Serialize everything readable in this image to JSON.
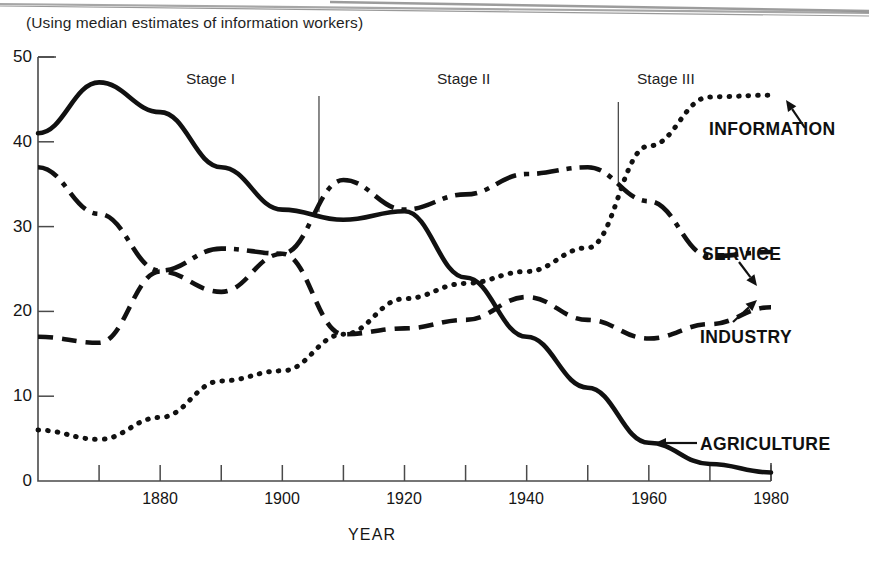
{
  "figure": {
    "subtitle": "(Using median estimates of information workers)",
    "xaxis_title": "YEAR"
  },
  "chart_data": {
    "type": "line",
    "title": "",
    "subtitle": "(Using median estimates of information workers)",
    "xlabel": "YEAR",
    "ylabel": "",
    "xlim": [
      1860,
      1980
    ],
    "ylim": [
      0,
      50
    ],
    "grid": false,
    "legend_position": "inline-right-annotations",
    "x_tick_labels": [
      "1880",
      "1900",
      "1920",
      "1940",
      "1960",
      "1980"
    ],
    "x_tick_values": [
      1880,
      1900,
      1920,
      1940,
      1960,
      1980
    ],
    "x_minor_ticks": [
      1860,
      1870,
      1880,
      1890,
      1900,
      1910,
      1920,
      1930,
      1940,
      1950,
      1960,
      1970,
      1980
    ],
    "y_tick_labels": [
      "0",
      "10",
      "20",
      "30",
      "40",
      "50"
    ],
    "y_tick_values": [
      0,
      10,
      20,
      30,
      40,
      50
    ],
    "x": [
      1860,
      1870,
      1880,
      1890,
      1900,
      1910,
      1920,
      1930,
      1940,
      1950,
      1960,
      1970,
      1980
    ],
    "series": [
      {
        "name": "AGRICULTURE",
        "style": "solid",
        "values": [
          41.0,
          47.0,
          43.5,
          37.0,
          32.0,
          30.8,
          31.8,
          24.0,
          17.0,
          11.0,
          4.5,
          2.0,
          1.0
        ]
      },
      {
        "name": "INDUSTRY",
        "style": "dashed",
        "values": [
          17.0,
          16.3,
          24.7,
          22.3,
          26.8,
          17.3,
          18.0,
          19.0,
          21.7,
          19.0,
          16.8,
          18.5,
          20.5
        ]
      },
      {
        "name": "SERVICE",
        "style": "dash-dot",
        "values": [
          37.0,
          31.5,
          24.8,
          27.4,
          26.8,
          35.5,
          32.0,
          33.8,
          36.2,
          37.0,
          33.0,
          26.5,
          27.0
        ]
      },
      {
        "name": "INFORMATION",
        "style": "dotted",
        "values": [
          6.0,
          4.9,
          7.5,
          11.8,
          13.0,
          17.3,
          21.5,
          23.3,
          24.7,
          27.5,
          39.5,
          45.3,
          45.5
        ]
      }
    ],
    "annotations": [
      {
        "text": "Stage I",
        "kind": "stage-label",
        "x": 1889
      },
      {
        "text": "Stage II",
        "kind": "stage-label",
        "x": 1931
      },
      {
        "text": "Stage III",
        "kind": "stage-label",
        "x": 1958
      },
      {
        "text": "Stage I / Stage II divider",
        "kind": "divider",
        "x": 1906
      },
      {
        "text": "Stage II / Stage III divider",
        "kind": "divider",
        "x": 1955
      }
    ],
    "series_callouts": [
      {
        "label": "INFORMATION",
        "points_to": "INFORMATION"
      },
      {
        "label": "SERVICE",
        "points_to": "SERVICE"
      },
      {
        "label": "INDUSTRY",
        "points_to": "INDUSTRY"
      },
      {
        "label": "AGRICULTURE",
        "points_to": "AGRICULTURE"
      }
    ]
  },
  "axis": {
    "y_labels": [
      "50",
      "40",
      "30",
      "20",
      "10",
      "0"
    ],
    "x_labels": [
      "1880",
      "1900",
      "1920",
      "1940",
      "1960",
      "1980"
    ]
  },
  "stages": {
    "one": "Stage I",
    "two": "Stage II",
    "three": "Stage III"
  },
  "series_labels": {
    "information": "INFORMATION",
    "service": "SERVICE",
    "industry": "INDUSTRY",
    "agriculture": "AGRICULTURE"
  },
  "colors": {
    "ink": "#111111",
    "axis": "#4a4a4a",
    "background": "#ffffff"
  }
}
